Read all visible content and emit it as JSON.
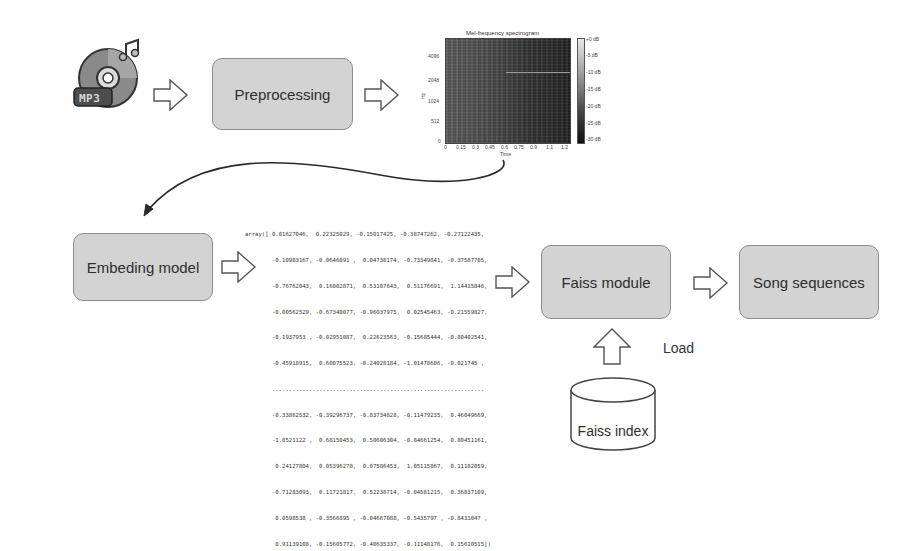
{
  "diagram": {
    "nodes": {
      "mp3_icon": {
        "label": "MP3",
        "icon": "mp3-disc-icon"
      },
      "preprocessing": {
        "label": "Preprocessing"
      },
      "spectrogram": {
        "title": "Mel-frequency spectrogram",
        "xlabel": "Time",
        "ylabel": "Hz",
        "x_ticks": [
          "0",
          "0.15",
          "0.3",
          "0.45",
          "0.6",
          "0.75",
          "0.9",
          "1.1",
          "1.2"
        ],
        "y_ticks": [
          "0",
          "512",
          "1024",
          "2048",
          "4096"
        ],
        "colorbar_ticks": [
          "+0 dB",
          "-5 dB",
          "-10 dB",
          "-15 dB",
          "-20 dB",
          "-25 dB",
          "-30 dB"
        ]
      },
      "embedding_model": {
        "label": "Embeding model"
      },
      "embedding_array": {
        "lines": [
          "array([ 0.01627046,  0.22325029, -0.15017425, -0.38747262, -0.27122435,",
          "        -0.10903167, -0.0646091 ,  0.04738174, -0.73349841, -0.37587705,",
          "        -0.76762043,  0.16002871,  0.53107643,  0.51176691,  1.14415846,",
          "        -0.00562529, -0.67340077, -0.96037975,  0.02545463, -0.21559827,",
          "        -0.1937953 , -0.02951087,  0.22623563, -0.15685444, -0.80402541,",
          "        -0.45918915,  0.60075523, -0.24028184, -1.01478606, -0.021745 ,",
          "        ...............................................................",
          "        -0.33862532, -0.39296737, -0.83734828, -0.11479235,  0.46049669,",
          "        -1.0521122 ,  0.68150453,  0.58606304, -0.84661254,  0.80451161,",
          "         0.24127804,  0.05396278,  0.07586453,  1.05115867,  0.11182059,",
          "        -0.71283093,  0.11721817,  0.52238714, -0.04581215,  0.36837109,",
          "         0.0598538 , -0.3566895 , -0.04667088, -0.5435797 , -0.8431047 ,",
          "         0.91139108, -0.15605772, -0.40635337, -0.11148176,  0.15610515])"
        ]
      },
      "faiss_module": {
        "label": "Faiss module"
      },
      "song_sequences": {
        "label": "Song sequences"
      },
      "faiss_index": {
        "label": "Faiss index"
      }
    },
    "edge_labels": {
      "load": "Load"
    },
    "colors": {
      "box_fill": "#d3d3d3",
      "box_border": "#8c8c8c",
      "arrow_stroke": "#555555",
      "curve_stroke": "#2a2a2a"
    }
  }
}
